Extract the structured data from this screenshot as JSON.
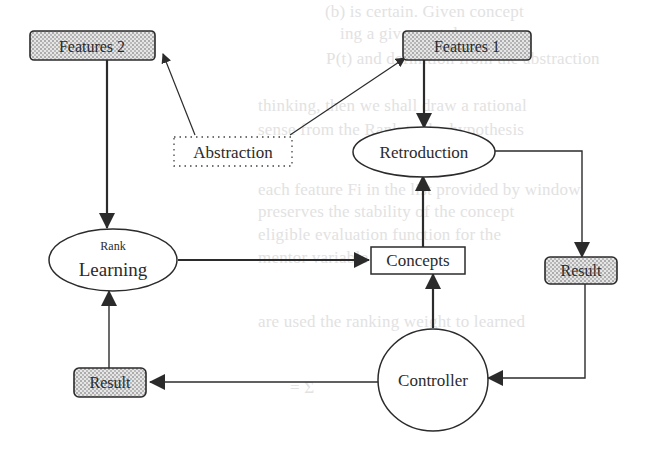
{
  "diagram": {
    "type": "flowchart",
    "nodes": {
      "features2": {
        "label": "Features 2",
        "shape": "rounded-rect",
        "fill": "stippled"
      },
      "features1": {
        "label": "Features 1",
        "shape": "rounded-rect",
        "fill": "stippled"
      },
      "abstraction": {
        "label": "Abstraction",
        "shape": "dotted-rect"
      },
      "retroduction": {
        "label": "Retroduction",
        "shape": "ellipse"
      },
      "rank_learning": {
        "label_top": "Rank",
        "label_main": "Learning",
        "shape": "ellipse"
      },
      "concepts": {
        "label": "Concepts",
        "shape": "rect"
      },
      "result_right": {
        "label": "Result",
        "shape": "rounded-rect",
        "fill": "stippled"
      },
      "result_left": {
        "label": "Result",
        "shape": "rounded-rect",
        "fill": "stippled"
      },
      "controller": {
        "label": "Controller",
        "shape": "circle"
      }
    },
    "edges": [
      {
        "from": "Abstraction",
        "to": "Features 2"
      },
      {
        "from": "Abstraction",
        "to": "Features 1"
      },
      {
        "from": "Features 2",
        "to": "Rank Learning"
      },
      {
        "from": "Features 1",
        "to": "Retroduction"
      },
      {
        "from": "Rank Learning",
        "to": "Concepts"
      },
      {
        "from": "Concepts",
        "to": "Retroduction"
      },
      {
        "from": "Controller",
        "to": "Concepts"
      },
      {
        "from": "Retroduction",
        "to": "Result (right)"
      },
      {
        "from": "Result (right)",
        "to": "Controller"
      },
      {
        "from": "Controller",
        "to": "Result (left)"
      },
      {
        "from": "Result (left)",
        "to": "Rank Learning"
      }
    ],
    "colors": {
      "stroke": "#2b2b2b",
      "stipple_bg": "#e6e6e6",
      "stipple_dot": "#555555",
      "bleed_text": "#e2e2e2"
    }
  },
  "background_bleed_text": [
    "(b) is certain. Given concept",
    "ing a given ontology",
    "P(t) and definition from the abstraction",
    "thinking, then we shall draw a rational",
    "sense from the Rank to the hypothesis",
    "each feature Fi in the list provided by window",
    "preserves the stability of the concept",
    "eligible evaluation function for the",
    "mentor variable (Table 2)",
    "are used the ranking weight to learned",
    "= Σ"
  ]
}
